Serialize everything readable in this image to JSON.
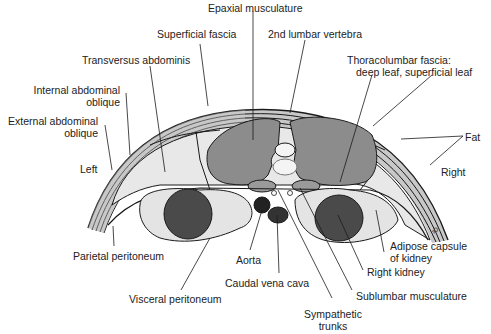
{
  "figure": {
    "type": "anatomical cross-section",
    "colors": {
      "outline": "#1a1a1a",
      "fat": "#e8e8e8",
      "muscle": "#8c8c8c",
      "kidney": "#4a4a4a",
      "aorta": "#222222",
      "vena_cava": "#333333",
      "sublumbar": "#9a9a9a",
      "adipose": "#e4e4e4",
      "vertebra": "#f4f4f4"
    },
    "signature": "ⓑ"
  },
  "labels": {
    "epaxial": "Epaxial musculature",
    "superficial_fascia": "Superficial fascia",
    "lumbar": "2nd lumbar vertebra",
    "transversus": "Transversus abdominis",
    "thoraco_1": "Thoracolumbar fascia:",
    "thoraco_2": "deep leaf, superficial leaf",
    "internal_1": "Internal abdominal",
    "internal_2": "oblique",
    "external_1": "External abdominal",
    "external_2": "oblique",
    "fat": "Fat",
    "left": "Left",
    "right": "Right",
    "parietal": "Parietal peritoneum",
    "adipose_1": "Adipose capsule",
    "adipose_2": "of kidney",
    "aorta": "Aorta",
    "right_kidney": "Right kidney",
    "caudal_vena_cava": "Caudal vena cava",
    "sublumbar": "Sublumbar musculature",
    "visceral": "Visceral peritoneum",
    "sympathetic_1": "Sympathetic",
    "sympathetic_2": "trunks"
  }
}
